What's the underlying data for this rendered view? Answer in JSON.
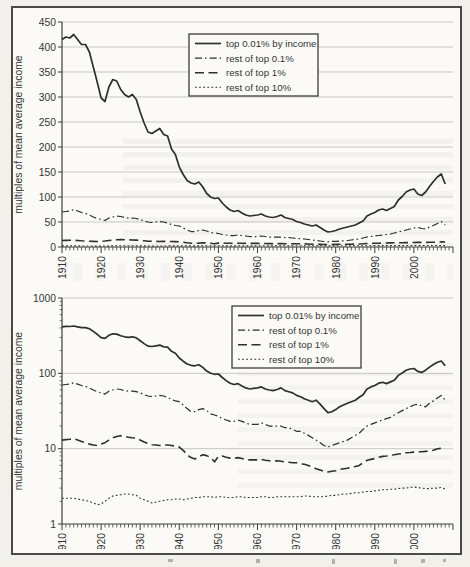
{
  "page": {
    "background": "#f2f0ea",
    "frame_color": "#4a4a48"
  },
  "chart_data": {
    "type": "line",
    "title": "",
    "xlabel": "",
    "ylabel": "multiples of mean average income",
    "x_start": 1910,
    "x_end": 2008,
    "x_axis_end": 2010,
    "xtick_labels": [
      "1910",
      "1920",
      "1930",
      "1940",
      "1950",
      "1960",
      "1970",
      "1980",
      "1990",
      "2000"
    ],
    "legend_entries": [
      "top 0.01% by income",
      "rest of top 0.1%",
      "rest of top 1%",
      "rest of top 10%"
    ],
    "colors": {
      "line": "#2e2e2e",
      "grid": "#c9c7c2",
      "axis": "#3c3c3c",
      "text": "#343434",
      "legend_bg": "#fbfaf6"
    },
    "charts": [
      {
        "name": "top-linear",
        "scale": "linear",
        "ylim": [
          0,
          450
        ],
        "yticks": [
          0,
          50,
          100,
          150,
          200,
          250,
          300,
          350,
          400,
          450
        ],
        "grid": true,
        "legend_position": "top-center"
      },
      {
        "name": "bottom-log",
        "scale": "log",
        "ylim": [
          1,
          1000
        ],
        "yticks": [
          1,
          10,
          100,
          1000
        ],
        "grid": true,
        "legend_position": "top-right"
      }
    ],
    "series": [
      {
        "name": "top 0.01% by income",
        "style": "solid",
        "values": [
          415,
          420,
          418,
          425,
          415,
          405,
          405,
          390,
          360,
          330,
          298,
          291,
          320,
          335,
          332,
          315,
          305,
          300,
          305,
          295,
          270,
          248,
          230,
          227,
          232,
          237,
          225,
          222,
          196,
          185,
          160,
          145,
          133,
          128,
          126,
          130,
          120,
          107,
          100,
          97,
          98,
          88,
          80,
          74,
          71,
          73,
          68,
          64,
          62,
          63,
          64,
          66,
          62,
          60,
          59,
          61,
          64,
          59,
          57,
          55,
          51,
          49,
          46,
          44,
          42,
          44,
          39,
          34,
          30,
          31,
          33,
          36,
          38,
          40,
          42,
          44,
          48,
          52,
          62,
          66,
          69,
          74,
          76,
          73,
          77,
          81,
          94,
          101,
          110,
          114,
          116,
          106,
          103,
          110,
          121,
          131,
          140,
          146,
          126
        ]
      },
      {
        "name": "rest of top 0.1%",
        "style": "dash-dot",
        "values": [
          70,
          71,
          72,
          75,
          72,
          69,
          67,
          64,
          60,
          57,
          55,
          53,
          58,
          60,
          62,
          61,
          59,
          58,
          58,
          57,
          55,
          52,
          50,
          49,
          50,
          51,
          50,
          48,
          45,
          43,
          42,
          38,
          34,
          31,
          31,
          33,
          34,
          32,
          29,
          28,
          27,
          25,
          24,
          23,
          23,
          24,
          23,
          22,
          21,
          21,
          21,
          22,
          21,
          20,
          20,
          20,
          20,
          19,
          19,
          18,
          17,
          17,
          16,
          15,
          14,
          13,
          12,
          11,
          10.5,
          11,
          11.5,
          12,
          12.5,
          13,
          14,
          15,
          16,
          18,
          20,
          21,
          22,
          23,
          24,
          25,
          26,
          28,
          30,
          32,
          34,
          36,
          38,
          39,
          37,
          36,
          40,
          43,
          47,
          51,
          44
        ]
      },
      {
        "name": "rest of top 1%",
        "style": "long-dash",
        "values": [
          13,
          13.2,
          13.3,
          13.5,
          13,
          12.5,
          12,
          11.5,
          11.2,
          11,
          11.5,
          12,
          13,
          14,
          14.5,
          14.8,
          14.5,
          14.2,
          14,
          13.8,
          13,
          12.3,
          11.7,
          11.3,
          11.2,
          11,
          11.2,
          11.2,
          11,
          10.8,
          10.5,
          9.5,
          8.3,
          7.6,
          7.3,
          7.8,
          8.3,
          8.1,
          7.6,
          6.7,
          7.9,
          8,
          7.7,
          7.5,
          7.4,
          7.6,
          7.4,
          7.2,
          7.1,
          7.1,
          7.1,
          7.2,
          7,
          6.9,
          6.8,
          6.9,
          6.8,
          6.7,
          6.6,
          6.5,
          6.5,
          6.3,
          6.2,
          6,
          5.7,
          5.4,
          5.2,
          5,
          4.9,
          5,
          5.1,
          5.3,
          5.4,
          5.5,
          5.7,
          5.8,
          6,
          6.5,
          7,
          7.2,
          7.4,
          7.7,
          7.9,
          8,
          8.2,
          8.3,
          8.5,
          8.6,
          8.8,
          8.9,
          9,
          9.1,
          9.1,
          9.2,
          9.3,
          9.5,
          10,
          10.1,
          10
        ]
      },
      {
        "name": "rest of top 10%",
        "style": "dotted",
        "values": [
          2.2,
          2.2,
          2.2,
          2.2,
          2.15,
          2.1,
          2.05,
          2,
          1.9,
          1.8,
          1.85,
          2,
          2.2,
          2.35,
          2.4,
          2.45,
          2.5,
          2.5,
          2.45,
          2.4,
          2.2,
          2.1,
          2,
          1.9,
          1.95,
          2,
          2.05,
          2.1,
          2.1,
          2.15,
          2.15,
          2.1,
          2.15,
          2.2,
          2.25,
          2.25,
          2.3,
          2.3,
          2.3,
          2.25,
          2.3,
          2.3,
          2.25,
          2.25,
          2.25,
          2.3,
          2.3,
          2.25,
          2.25,
          2.25,
          2.25,
          2.3,
          2.3,
          2.25,
          2.25,
          2.3,
          2.3,
          2.3,
          2.3,
          2.3,
          2.3,
          2.3,
          2.35,
          2.35,
          2.3,
          2.3,
          2.3,
          2.3,
          2.35,
          2.4,
          2.4,
          2.45,
          2.5,
          2.5,
          2.55,
          2.6,
          2.6,
          2.65,
          2.7,
          2.7,
          2.75,
          2.8,
          2.85,
          2.85,
          2.9,
          2.9,
          2.95,
          3,
          3,
          3.05,
          3.1,
          3.05,
          3,
          2.95,
          2.95,
          3,
          3,
          3.05,
          2.9
        ]
      }
    ]
  }
}
